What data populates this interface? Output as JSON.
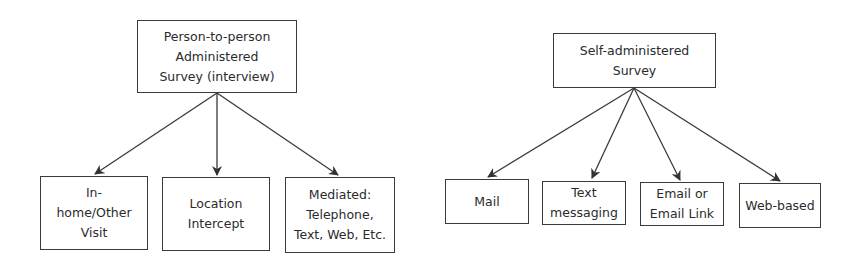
{
  "diagrams": [
    {
      "root": {
        "label": "Person-to-person Administered Survey (interview)",
        "lines": [
          "Person-to-person",
          "Administered",
          "Survey (interview)"
        ]
      },
      "children": [
        {
          "label": "In-home/Other Visit",
          "lines": [
            "In-",
            "home/Other",
            "Visit"
          ]
        },
        {
          "label": "Location Intercept",
          "lines": [
            "Location",
            "Intercept"
          ]
        },
        {
          "label": "Mediated: Telephone, Text, Web, Etc.",
          "lines": [
            "Mediated:",
            "Telephone,",
            "Text, Web, Etc."
          ]
        }
      ]
    },
    {
      "root": {
        "label": "Self-administered Survey",
        "lines": [
          "Self-administered",
          "Survey"
        ]
      },
      "children": [
        {
          "label": "Mail",
          "lines": [
            "Mail"
          ]
        },
        {
          "label": "Text messaging",
          "lines": [
            "Text",
            "messaging"
          ]
        },
        {
          "label": "Email or Email Link",
          "lines": [
            "Email or",
            "Email Link"
          ]
        },
        {
          "label": "Web-based",
          "lines": [
            "Web-based"
          ]
        }
      ]
    }
  ],
  "colors": {
    "stroke": "#3a3a3a",
    "text": "#2b2b2b",
    "background": "#ffffff"
  }
}
